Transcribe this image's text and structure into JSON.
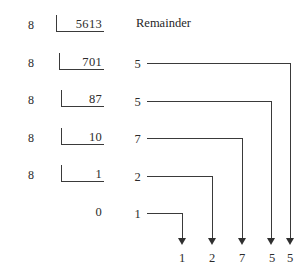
{
  "diagram": {
    "title_header": "Remainder",
    "divisor_label": "8",
    "division_rows": [
      {
        "divisor": "8",
        "dividend": "5613",
        "remainder": ""
      },
      {
        "divisor": "8",
        "dividend": "701",
        "remainder": "5"
      },
      {
        "divisor": "8",
        "dividend": "87",
        "remainder": "5"
      },
      {
        "divisor": "8",
        "dividend": "10",
        "remainder": "7"
      },
      {
        "divisor": "8",
        "dividend": "1",
        "remainder": "2"
      },
      {
        "divisor": "",
        "dividend": "0",
        "remainder": "1"
      }
    ],
    "result_digits": [
      "1",
      "2",
      "7",
      "5",
      "5"
    ],
    "colors": {
      "ink": "#2b2b2b",
      "rule": "#3a3a3a",
      "background": "#ffffff"
    }
  }
}
